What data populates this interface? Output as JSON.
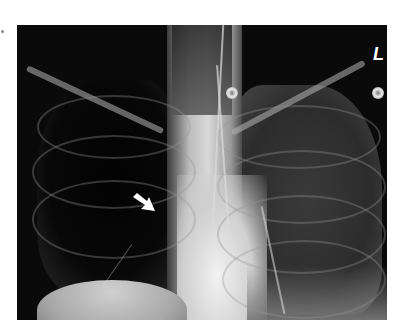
{
  "image": {
    "type": "chest-radiograph",
    "view": "frontal",
    "side_marker": "L",
    "annotations": [
      {
        "type": "arrow",
        "color": "#ffffff",
        "direction": "down-right",
        "position": "right hemithorax near mediastinal border"
      }
    ],
    "features": [
      "ECG electrodes",
      "lines/tubes over mediastinum",
      "hyperlucent right hemithorax"
    ]
  }
}
